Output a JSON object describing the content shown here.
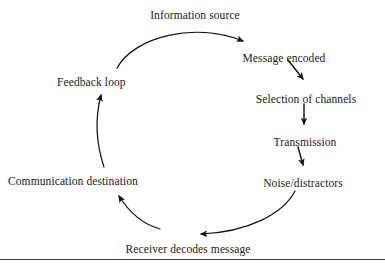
{
  "figure": {
    "kind": "cycle-diagram",
    "background_color": "#ffffff",
    "text_color": "#1a1a1a",
    "stroke_color": "#111111",
    "rule_color": "#3a3a3a",
    "rule_y": 259
  },
  "nodes": [
    {
      "id": "information-source",
      "label": "Information source",
      "x": 195,
      "y": 9,
      "align": "center"
    },
    {
      "id": "message-encoded",
      "label": "Message encoded",
      "x": 284,
      "y": 52,
      "align": "center"
    },
    {
      "id": "selection-of-channels",
      "label": "Selection of channels",
      "x": 306,
      "y": 93,
      "align": "center"
    },
    {
      "id": "transmission",
      "label": "Transmission",
      "x": 305,
      "y": 136,
      "align": "center"
    },
    {
      "id": "noise-distractors",
      "label": "Noise/distractors",
      "x": 303,
      "y": 177,
      "align": "center"
    },
    {
      "id": "receiver-decodes-message",
      "label": "Receiver decodes message",
      "x": 188,
      "y": 243,
      "align": "center"
    },
    {
      "id": "communication-destination",
      "label": "Communication destination",
      "x": 8,
      "y": 175,
      "align": "left"
    },
    {
      "id": "feedback-loop",
      "label": "Feedback loop",
      "x": 57,
      "y": 76,
      "align": "left"
    }
  ],
  "connectors": [
    {
      "id": "arc-source-to-message",
      "from": "information-source",
      "to": "message-encoded",
      "style": "curved-arc",
      "direction": "clockwise"
    },
    {
      "id": "arrow-message-to-selection",
      "from": "message-encoded",
      "to": "selection-of-channels",
      "style": "short-diagonal",
      "direction": "down-right"
    },
    {
      "id": "arrow-selection-to-transmission",
      "from": "selection-of-channels",
      "to": "transmission",
      "style": "short-vertical",
      "direction": "down"
    },
    {
      "id": "arrow-transmission-to-noise",
      "from": "transmission",
      "to": "noise-distractors",
      "style": "short-vertical",
      "direction": "down"
    },
    {
      "id": "arc-noise-to-receiver",
      "from": "noise-distractors",
      "to": "receiver-decodes-message",
      "style": "curved-arc",
      "direction": "clockwise"
    },
    {
      "id": "arrow-receiver-to-destination",
      "from": "receiver-decodes-message",
      "to": "communication-destination",
      "style": "curved-arc",
      "direction": "up-left"
    },
    {
      "id": "arc-destination-to-feedback",
      "from": "communication-destination",
      "to": "feedback-loop",
      "style": "curved-arc",
      "direction": "up"
    },
    {
      "id": "arc-feedback-to-source",
      "from": "feedback-loop",
      "to": "information-source",
      "style": "curved-arc",
      "direction": "up-right"
    }
  ]
}
